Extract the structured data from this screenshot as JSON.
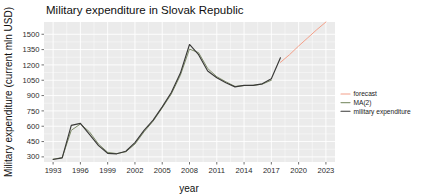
{
  "chart_data": {
    "type": "line",
    "title": "Military expenditure in Slovak Republic",
    "xlabel": "year",
    "ylabel": "Military expenditure (current mln USD)",
    "xlim": [
      1992,
      2024
    ],
    "ylim": [
      250,
      1620
    ],
    "grid": true,
    "legend_position": "right",
    "x_ticks": [
      "1993",
      "1996",
      "1999",
      "2002",
      "2005",
      "2008",
      "2011",
      "2014",
      "2017",
      "2020",
      "2023"
    ],
    "x_tick_values": [
      1993,
      1996,
      1999,
      2002,
      2005,
      2008,
      2011,
      2014,
      2017,
      2020,
      2023
    ],
    "y_ticks": [
      "300",
      "450",
      "600",
      "750",
      "900",
      "1050",
      "1200",
      "1350",
      "1500"
    ],
    "y_tick_values": [
      300,
      450,
      600,
      750,
      900,
      1050,
      1200,
      1350,
      1500
    ],
    "series": [
      {
        "name": "military expenditure",
        "color": "#3a3a38",
        "x": [
          1993,
          1994,
          1995,
          1996,
          1997,
          1998,
          1999,
          2000,
          2001,
          2002,
          2003,
          2004,
          2005,
          2006,
          2007,
          2008,
          2009,
          2010,
          2011,
          2012,
          2013,
          2014,
          2015,
          2016,
          2017,
          2018
        ],
        "values": [
          275,
          290,
          608,
          628,
          520,
          410,
          335,
          330,
          355,
          440,
          560,
          660,
          790,
          930,
          1120,
          1400,
          1300,
          1140,
          1075,
          1025,
          985,
          1000,
          1000,
          1015,
          1065,
          1270
        ]
      },
      {
        "name": "MA(2)",
        "color": "#7f8c6a",
        "x": [
          1993,
          1994,
          1995,
          1996,
          1997,
          1998,
          1999,
          2000,
          2001,
          2002,
          2003,
          2004,
          2005,
          2006,
          2007,
          2008,
          2009,
          2010,
          2011,
          2012,
          2013,
          2014,
          2015,
          2016,
          2017
        ],
        "values": [
          278,
          292,
          560,
          622,
          545,
          425,
          345,
          332,
          350,
          425,
          545,
          650,
          780,
          915,
          1100,
          1355,
          1320,
          1165,
          1085,
          1035,
          990,
          998,
          1000,
          1012,
          1050
        ]
      },
      {
        "name": "forecast",
        "color": "#f4a089",
        "x": [
          2018,
          2019,
          2020,
          2021,
          2022,
          2023
        ],
        "values": [
          1225,
          1300,
          1385,
          1465,
          1545,
          1620
        ]
      }
    ],
    "legend_entries": [
      {
        "label": "forecast",
        "color": "#f4a089"
      },
      {
        "label": "MA(2)",
        "color": "#8b9b78"
      },
      {
        "label": "military expenditure",
        "color": "#3a3a38"
      }
    ],
    "panel_background": "#ebebeb",
    "gridline_color": "#ffffff"
  }
}
